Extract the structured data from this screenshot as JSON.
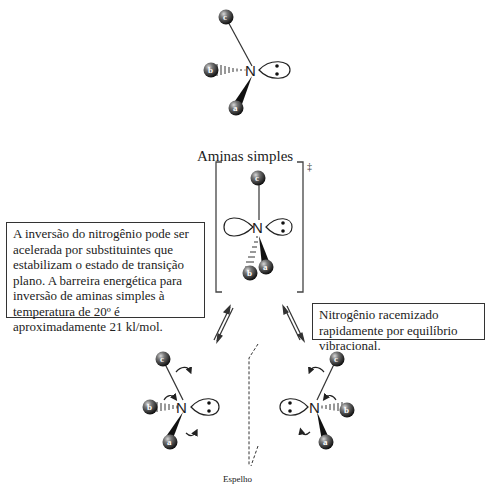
{
  "title": "Aminas simples",
  "transition_state_symbol": "‡",
  "note_left": "A inversão do nitrogênio pode ser acelerada por substituintes que estabilizam o estado de transição plano. A barreira energética para inversão de aminas simples à temperatura de 20º é aproximadamente 21 kl/mol.",
  "note_right": "Nitrogênio racemizado rapidamente por equilíbrio vibracional.",
  "mirror_label": "Espelho",
  "atoms": {
    "central": "N",
    "substituents": [
      "a",
      "b",
      "c"
    ]
  },
  "structures": [
    {
      "name": "amine-top",
      "description": "Tetrahedral amine with lone pair on right"
    },
    {
      "name": "transition-state",
      "description": "Planar sp2 nitrogen with p-orbital, in brackets"
    },
    {
      "name": "enantiomer-left",
      "description": "Amine with lone pair on right"
    },
    {
      "name": "enantiomer-right",
      "description": "Mirror-image amine with lone pair on left"
    }
  ],
  "colors": {
    "atom": "#3a3a3a",
    "line": "#333333"
  }
}
